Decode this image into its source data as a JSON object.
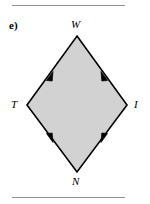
{
  "figure": {
    "part_label": "e)",
    "background_color": "#ffffff",
    "rules": {
      "color": "#8f8f8f",
      "top_visible": true,
      "bottom_visible": true
    },
    "shape": {
      "name": "rhombus",
      "fill_color": "#d2d2d2",
      "stroke_color": "#000000",
      "stroke_width": 1.6,
      "vertices": [
        {
          "label": "W",
          "x": 77,
          "y": 36
        },
        {
          "label": "I",
          "x": 127,
          "y": 105
        },
        {
          "label": "N",
          "x": 77,
          "y": 172
        },
        {
          "label": "T",
          "x": 27,
          "y": 105
        }
      ],
      "edges": [
        {
          "name": "edge-T-W",
          "from": "T",
          "to": "W",
          "tick_marks": 1,
          "arrow_direction": "toward-W"
        },
        {
          "name": "edge-I-W",
          "from": "I",
          "to": "W",
          "tick_marks": 1,
          "arrow_direction": "toward-W"
        },
        {
          "name": "edge-N-T",
          "from": "N",
          "to": "T",
          "tick_marks": 1,
          "arrow_direction": "toward-T"
        },
        {
          "name": "edge-N-I",
          "from": "N",
          "to": "I",
          "tick_marks": 1,
          "arrow_direction": "toward-I"
        }
      ]
    },
    "labels": {
      "top": "W",
      "left": "T",
      "right": "I",
      "bottom": "N"
    }
  }
}
